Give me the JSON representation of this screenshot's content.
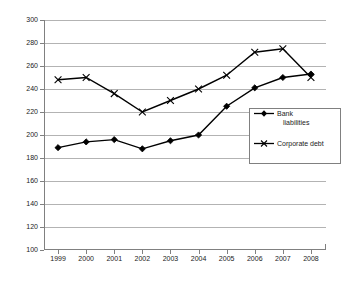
{
  "chart_data": {
    "type": "line",
    "title": "",
    "xlabel": "",
    "ylabel": "",
    "categories": [
      "1999",
      "2000",
      "2001",
      "2002",
      "2003",
      "2004",
      "2005",
      "2006",
      "2007",
      "2008"
    ],
    "ylim": [
      100,
      300
    ],
    "yticks": [
      100,
      120,
      140,
      160,
      180,
      200,
      220,
      240,
      260,
      280,
      300
    ],
    "grid": true,
    "legend_position": "inside-right",
    "series": [
      {
        "name": "Bank liabilities",
        "marker": "filled-diamond",
        "color": "#000000",
        "values": [
          189,
          194,
          196,
          188,
          195,
          200,
          225,
          241,
          250,
          253
        ]
      },
      {
        "name": "Corporate debt",
        "marker": "x-cross",
        "color": "#000000",
        "values": [
          248,
          250,
          236,
          220,
          230,
          240,
          252,
          272,
          275,
          250
        ]
      }
    ]
  },
  "legend": {
    "items": [
      {
        "label_line1": "Bank",
        "label_line2": "liabilities"
      },
      {
        "label_line1": "Corporate  debt",
        "label_line2": ""
      }
    ]
  },
  "axis": {
    "y_labels": [
      "300",
      "280",
      "260",
      "240",
      "220",
      "200",
      "180",
      "160",
      "140",
      "120",
      "100"
    ],
    "x_labels": [
      "1999",
      "2000",
      "2001",
      "2002",
      "2003",
      "2004",
      "2005",
      "2006",
      "2007",
      "2008"
    ]
  }
}
